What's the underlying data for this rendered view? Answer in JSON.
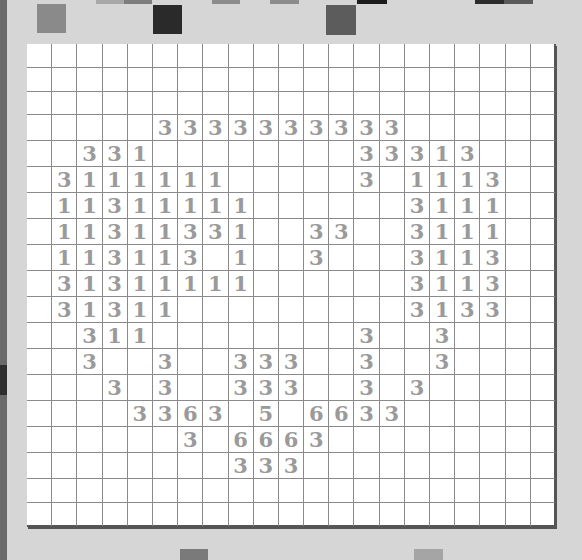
{
  "game": {
    "columns": 21,
    "rows": 19,
    "digit_color": "#9a9a9a",
    "cells": [
      [
        "",
        "",
        "",
        "",
        "",
        "",
        "",
        "",
        "",
        "",
        "",
        "",
        "",
        "",
        "",
        "",
        "",
        "",
        "",
        "",
        ""
      ],
      [
        "",
        "",
        "",
        "",
        "",
        "",
        "",
        "",
        "",
        "",
        "",
        "",
        "",
        "",
        "",
        "",
        "",
        "",
        "",
        "",
        ""
      ],
      [
        "",
        "",
        "",
        "",
        "",
        "",
        "",
        "",
        "",
        "",
        "",
        "",
        "",
        "",
        "",
        "",
        "",
        "",
        "",
        "",
        ""
      ],
      [
        "",
        "",
        "",
        "",
        "",
        "3",
        "3",
        "3",
        "3",
        "3",
        "3",
        "3",
        "3",
        "3",
        "3",
        "",
        "",
        "",
        "",
        "",
        ""
      ],
      [
        "",
        "",
        "3",
        "3",
        "1",
        "",
        "",
        "",
        "",
        "",
        "",
        "",
        "",
        "3",
        "3",
        "3",
        "1",
        "3",
        "",
        "",
        ""
      ],
      [
        "",
        "3",
        "1",
        "1",
        "1",
        "1",
        "1",
        "1",
        "",
        "",
        "",
        "",
        "",
        "3",
        "",
        "1",
        "1",
        "1",
        "3",
        "",
        ""
      ],
      [
        "",
        "1",
        "1",
        "3",
        "1",
        "1",
        "1",
        "1",
        "1",
        "",
        "",
        "",
        "",
        "",
        "",
        "3",
        "1",
        "1",
        "1",
        "",
        ""
      ],
      [
        "",
        "1",
        "1",
        "3",
        "1",
        "1",
        "3",
        "3",
        "1",
        "",
        "",
        "3",
        "3",
        "",
        "",
        "3",
        "1",
        "1",
        "1",
        "",
        ""
      ],
      [
        "",
        "1",
        "1",
        "3",
        "1",
        "1",
        "3",
        "",
        "1",
        "",
        "",
        "3",
        "",
        "",
        "",
        "3",
        "1",
        "1",
        "3",
        "",
        ""
      ],
      [
        "",
        "3",
        "1",
        "3",
        "1",
        "1",
        "1",
        "1",
        "1",
        "",
        "",
        "",
        "",
        "",
        "",
        "3",
        "1",
        "1",
        "3",
        "",
        ""
      ],
      [
        "",
        "3",
        "1",
        "3",
        "1",
        "1",
        "",
        "",
        "",
        "",
        "",
        "",
        "",
        "",
        "",
        "3",
        "1",
        "3",
        "3",
        "",
        ""
      ],
      [
        "",
        "",
        "3",
        "1",
        "1",
        "",
        "",
        "",
        "",
        "",
        "",
        "",
        "",
        "3",
        "",
        "",
        "3",
        "",
        "",
        "",
        ""
      ],
      [
        "",
        "",
        "3",
        "",
        "",
        "3",
        "",
        "",
        "3",
        "3",
        "3",
        "",
        "",
        "3",
        "",
        "",
        "3",
        "",
        "",
        "",
        ""
      ],
      [
        "",
        "",
        "",
        "3",
        "",
        "3",
        "",
        "",
        "3",
        "3",
        "3",
        "",
        "",
        "3",
        "",
        "3",
        "",
        "",
        "",
        "",
        ""
      ],
      [
        "",
        "",
        "",
        "",
        "3",
        "3",
        "6",
        "3",
        "",
        "5",
        "",
        "6",
        "6",
        "3",
        "3",
        "",
        "",
        "",
        "",
        "",
        ""
      ],
      [
        "",
        "",
        "",
        "",
        "",
        "",
        "3",
        "",
        "6",
        "6",
        "6",
        "3",
        "",
        "",
        "",
        "",
        "",
        "",
        "",
        "",
        ""
      ],
      [
        "",
        "",
        "",
        "",
        "",
        "",
        "",
        "",
        "3",
        "3",
        "3",
        "",
        "",
        "",
        "",
        "",
        "",
        "",
        "",
        "",
        ""
      ],
      [
        "",
        "",
        "",
        "",
        "",
        "",
        "",
        "",
        "",
        "",
        "",
        "",
        "",
        "",
        "",
        "",
        "",
        "",
        "",
        "",
        ""
      ],
      [
        "",
        "",
        "",
        "",
        "",
        "",
        "",
        "",
        "",
        "",
        "",
        "",
        "",
        "",
        "",
        "",
        "",
        "",
        "",
        "",
        ""
      ]
    ]
  },
  "decor": {
    "top_squares": [
      {
        "x": 37,
        "y": 4,
        "w": 29,
        "h": 29,
        "color": "#8a8a8a"
      },
      {
        "x": 153,
        "y": 5,
        "w": 29,
        "h": 29,
        "color": "#2a2a2a"
      },
      {
        "x": 326,
        "y": 5,
        "w": 30,
        "h": 30,
        "color": "#5c5c5c"
      },
      {
        "x": 96,
        "y": 0,
        "w": 28,
        "h": 4,
        "color": "#a8a8a8"
      },
      {
        "x": 124,
        "y": 0,
        "w": 28,
        "h": 4,
        "color": "#7d7d7d"
      },
      {
        "x": 212,
        "y": 0,
        "w": 28,
        "h": 4,
        "color": "#8c8c8c"
      },
      {
        "x": 270,
        "y": 0,
        "w": 29,
        "h": 4,
        "color": "#8c8c8c"
      },
      {
        "x": 357,
        "y": 0,
        "w": 30,
        "h": 4,
        "color": "#1c1c1c"
      },
      {
        "x": 475,
        "y": 0,
        "w": 29,
        "h": 4,
        "color": "#2d2d2d"
      },
      {
        "x": 504,
        "y": 0,
        "w": 29,
        "h": 4,
        "color": "#5a5a5a"
      }
    ],
    "bottom_squares": [
      {
        "x": 180,
        "y": 549,
        "w": 28,
        "h": 11,
        "color": "#7a7a7a"
      },
      {
        "x": 414,
        "y": 549,
        "w": 29,
        "h": 11,
        "color": "#a5a5a5"
      }
    ]
  }
}
